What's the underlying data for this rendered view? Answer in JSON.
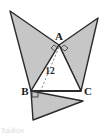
{
  "figure": {
    "caption_fragment": "Здійсн",
    "colors": {
      "fill": "#c6c6c6",
      "stroke": "#2b2b2b",
      "label": "#1a1a1a",
      "dashed": "#8a8a8a",
      "background": "#ffffff"
    },
    "labels": {
      "apex": "A",
      "bottom_left": "B",
      "bottom_right": "C",
      "height_value": "12"
    },
    "markers": {
      "right_angle_apex_left": "right-angle",
      "right_angle_apex_right": "right-angle",
      "right_angle_bottom_left": "right-angle"
    },
    "points": {
      "A": [
        59,
        45
      ],
      "B": [
        31,
        91
      ],
      "C": [
        81,
        91
      ],
      "left_tip": [
        10,
        11
      ],
      "right_tip": [
        98,
        18
      ],
      "bottom_tip": [
        33,
        120
      ],
      "bottom_right_corner": [
        83,
        101
      ],
      "height_foot": [
        46,
        91
      ]
    },
    "geometry": {
      "central_triangle": "A-B-C",
      "left_flap": "A-B-left_tip",
      "right_flap": "A-C-right_tip",
      "bottom_flap": "B-C-bottom_tip"
    }
  }
}
